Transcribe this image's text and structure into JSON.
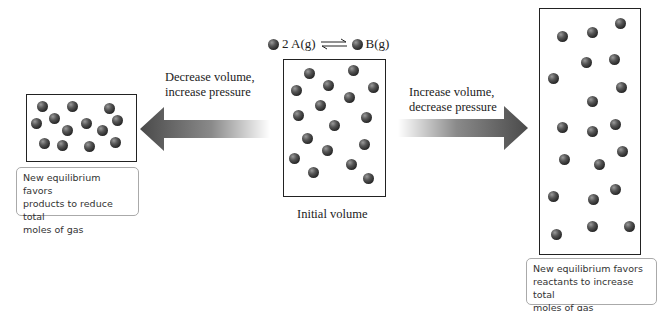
{
  "equation": {
    "reactant": "2 A(g)",
    "product": "B(g)",
    "arrow": "equilibrium-arrows"
  },
  "left": {
    "arrow_label_line1": "Decrease volume,",
    "arrow_label_line2": "increase pressure",
    "note_line1": "New equilibrium favors",
    "note_line2": "products to reduce total",
    "note_line3": "moles of gas",
    "molecule_count": 14
  },
  "center": {
    "caption": "Initial volume",
    "molecule_count": 18
  },
  "right": {
    "arrow_label_line1": "Increase volume,",
    "arrow_label_line2": "decrease pressure",
    "note_line1": "New equilibrium favors",
    "note_line2": "reactants to increase total",
    "note_line3": "moles of gas",
    "molecule_count": 20
  },
  "colors": {
    "molecule": "#2a2a2a",
    "arrow_dark": "#555555",
    "border": "#222222"
  }
}
